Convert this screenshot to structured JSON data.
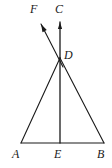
{
  "figure": {
    "type": "geometry-diagram",
    "stroke_color": "#1a1a1a",
    "background_color": "#ffffff",
    "points": [
      {
        "id": "A",
        "label": "A",
        "x": 21,
        "y": 143,
        "label_x": 12,
        "label_y": 148
      },
      {
        "id": "B",
        "label": "B",
        "x": 104,
        "y": 143,
        "label_x": 97,
        "label_y": 148
      },
      {
        "id": "C",
        "label": "C",
        "x": 60,
        "y": 22,
        "label_x": 55,
        "label_y": 3
      },
      {
        "id": "D",
        "label": "D",
        "x": 60,
        "y": 58,
        "label_x": 64,
        "label_y": 49
      },
      {
        "id": "E",
        "label": "E",
        "x": 60,
        "y": 143,
        "label_x": 54,
        "label_y": 148
      },
      {
        "id": "F",
        "label": "F",
        "x": 41,
        "y": 24,
        "label_x": 30,
        "label_y": 3
      }
    ],
    "segments": [
      {
        "name": "segment-AB",
        "from": "A",
        "to": "B",
        "x1": 21,
        "y1": 143,
        "x2": 104,
        "y2": 143,
        "width": 1.1
      },
      {
        "name": "segment-AD",
        "from": "A",
        "to": "D",
        "x1": 21,
        "y1": 143,
        "x2": 60,
        "y2": 58,
        "width": 1.1
      },
      {
        "name": "segment-DB",
        "from": "D",
        "to": "B",
        "x1": 60,
        "y1": 58,
        "x2": 104,
        "y2": 143,
        "width": 1.1
      },
      {
        "name": "segment-DE",
        "from": "D",
        "to": "E",
        "x1": 60,
        "y1": 58,
        "x2": 60,
        "y2": 143,
        "width": 1.3
      }
    ],
    "rays": [
      {
        "name": "ray-DC",
        "from": "D",
        "toward": "C",
        "x1": 60,
        "y1": 58,
        "x2": 60,
        "y2": 22,
        "width": 1.3,
        "arrow": true
      },
      {
        "name": "ray-DF",
        "from": "D",
        "toward": "F",
        "x1": 63,
        "y1": 67,
        "x2": 41,
        "y2": 24,
        "width": 1.1,
        "arrow": true
      }
    ]
  }
}
